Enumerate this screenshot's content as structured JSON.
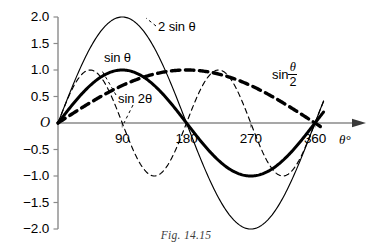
{
  "figure": {
    "caption": "Fig. 14.15",
    "background_color": "#ffffff",
    "axis_color": "#8a8a8a",
    "curve_color": "#000000"
  },
  "chart_data": {
    "type": "line",
    "title": "",
    "xlabel": "θ°",
    "ylabel": "",
    "xlim": [
      0,
      380
    ],
    "ylim": [
      -2.0,
      2.0
    ],
    "grid": false,
    "legend_position": "inline-annotations",
    "x_ticks": [
      90,
      180,
      270,
      360
    ],
    "x_tick_labels": [
      "90",
      "180",
      "270",
      "360"
    ],
    "y_ticks": [
      2.0,
      1.5,
      1.0,
      0.5,
      0,
      -0.5,
      -1.0,
      -1.5,
      -2.0
    ],
    "y_tick_labels": [
      "2.0",
      "1.5",
      "1.0",
      "0.5",
      "O",
      "−0.5",
      "−1.0",
      "−1.5",
      "−2.0"
    ],
    "origin_label": "O",
    "series": [
      {
        "name": "2 sin θ",
        "label_text": "2 sin θ",
        "amplitude": 2.0,
        "frequency": 1.0,
        "style": "thin-solid",
        "key_points": [
          {
            "x": 0,
            "y": 0
          },
          {
            "x": 90,
            "y": 2.0
          },
          {
            "x": 180,
            "y": 0
          },
          {
            "x": 270,
            "y": -2.0
          },
          {
            "x": 360,
            "y": 0
          }
        ]
      },
      {
        "name": "sin θ",
        "label_text": "sin θ",
        "amplitude": 1.0,
        "frequency": 1.0,
        "style": "thick-solid",
        "key_points": [
          {
            "x": 0,
            "y": 0
          },
          {
            "x": 90,
            "y": 1.0
          },
          {
            "x": 180,
            "y": 0
          },
          {
            "x": 270,
            "y": -1.0
          },
          {
            "x": 360,
            "y": 0
          }
        ]
      },
      {
        "name": "sin 2θ",
        "label_text": "sin 2θ",
        "amplitude": 1.0,
        "frequency": 2.0,
        "style": "thin-dashed",
        "key_points": [
          {
            "x": 0,
            "y": 0
          },
          {
            "x": 45,
            "y": 1.0
          },
          {
            "x": 90,
            "y": 0
          },
          {
            "x": 135,
            "y": -1.0
          },
          {
            "x": 180,
            "y": 0
          },
          {
            "x": 225,
            "y": 1.0
          },
          {
            "x": 270,
            "y": 0
          },
          {
            "x": 315,
            "y": -1.0
          },
          {
            "x": 360,
            "y": 0
          }
        ]
      },
      {
        "name": "sin θ/2",
        "label_numerator": "θ",
        "label_denominator": "2",
        "label_prefix": "sin",
        "amplitude": 1.0,
        "frequency": 0.5,
        "style": "thick-dashed",
        "key_points": [
          {
            "x": 0,
            "y": 0
          },
          {
            "x": 90,
            "y": 0.707
          },
          {
            "x": 180,
            "y": 1.0
          },
          {
            "x": 270,
            "y": 0.707
          },
          {
            "x": 360,
            "y": 0
          }
        ]
      }
    ]
  }
}
